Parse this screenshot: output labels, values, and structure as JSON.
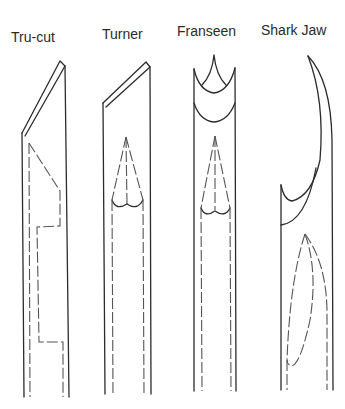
{
  "needles": [
    {
      "id": "tru-cut",
      "label": "Tru-cut"
    },
    {
      "id": "turner",
      "label": "Turner"
    },
    {
      "id": "franseen",
      "label": "Franseen"
    },
    {
      "id": "shark-jaw",
      "label": "Shark Jaw"
    }
  ],
  "colors": {
    "line": "#2b2b2b",
    "dashed": "#555555",
    "background": "#ffffff"
  }
}
